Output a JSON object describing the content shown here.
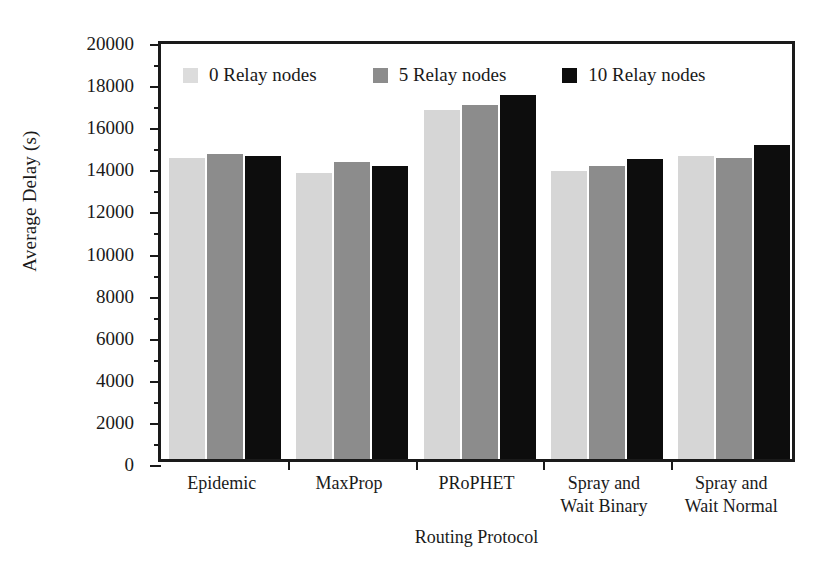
{
  "chart_data": {
    "type": "bar",
    "title": "",
    "xlabel": "Routing Protocol",
    "ylabel": "Average Delay (s)",
    "categories": [
      "Epidemic",
      "MaxProp",
      "PRoPHET",
      "Spray and Wait Binary",
      "Spray and Wait Normal"
    ],
    "category_lines": [
      [
        "Epidemic"
      ],
      [
        "MaxProp"
      ],
      [
        "PRoPHET"
      ],
      [
        "Spray and",
        "Wait Binary"
      ],
      [
        "Spray and",
        "Wait Normal"
      ]
    ],
    "series": [
      {
        "name": "0 Relay nodes",
        "color": "#d6d6d6",
        "values": [
          14300,
          13600,
          16600,
          13700,
          14400
        ]
      },
      {
        "name": "5 Relay nodes",
        "color": "#8c8c8c",
        "values": [
          14500,
          14100,
          16800,
          13900,
          14300
        ]
      },
      {
        "name": "10 Relay nodes",
        "color": "#0d0d0d",
        "values": [
          14400,
          13900,
          17300,
          14250,
          14900
        ]
      }
    ],
    "ylim": [
      0,
      20000
    ],
    "ytick_step": 2000,
    "yminor_step": 1000,
    "ytick_labels": [
      "0",
      "2000",
      "4000",
      "6000",
      "8000",
      "10000",
      "12000",
      "14000",
      "16000",
      "18000",
      "20000"
    ],
    "grid": false,
    "legend_position": "inside-top-left",
    "legend": [
      "0 Relay nodes",
      "5 Relay nodes",
      "10 Relay nodes"
    ]
  }
}
